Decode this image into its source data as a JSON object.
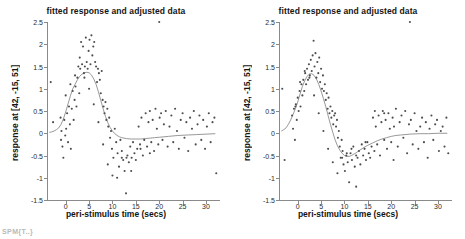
{
  "figure": {
    "bottom_fragment": "SPM{T..}",
    "accent_point_color": "#4d4d4d",
    "accent_curve_color": "#8c8c8c",
    "axis_color": "#8a8a8a"
  },
  "panels": [
    {
      "id": "left",
      "title": "fitted response and adjusted data",
      "ylabel": "response at [42, -15, 51]",
      "xlabel": "peri-stimulus time (secs)"
    },
    {
      "id": "right",
      "title": "fitted response and adjusted data",
      "ylabel": "response at [42, -15, 51]",
      "xlabel": "peri-stimulus time (secs)"
    }
  ],
  "chart_data": [
    {
      "type": "scatter",
      "panel": "left",
      "title": "fitted response and adjusted data",
      "xlabel": "peri-stimulus time (secs)",
      "ylabel": "response at [42, -15, 51]",
      "xlim": [
        -4,
        33
      ],
      "ylim": [
        -1.5,
        2.5
      ],
      "xticks": [
        0,
        5,
        10,
        15,
        20,
        25,
        30
      ],
      "yticks": [
        -1.5,
        -1,
        -0.5,
        0,
        0.5,
        1,
        1.5,
        2,
        2.5
      ],
      "xtick_labels": [
        "0",
        "5",
        "10",
        "15",
        "20",
        "25",
        "30"
      ],
      "ytick_labels": [
        "-1.5",
        "-1",
        "-0.5",
        "0",
        "0.5",
        "1",
        "1.5",
        "2",
        "2.5"
      ],
      "grid": false,
      "legend": null,
      "series": [
        {
          "name": "fitted response",
          "type": "line",
          "x": [
            -3.5,
            -3,
            -2.5,
            -2,
            -1.5,
            -1,
            -0.5,
            0,
            0.5,
            1,
            1.5,
            2,
            2.5,
            3,
            3.5,
            4,
            4.5,
            5,
            5.5,
            6,
            6.5,
            7,
            7.5,
            8,
            8.5,
            9,
            9.5,
            10,
            10.5,
            11,
            11.5,
            12,
            13,
            14,
            15,
            16,
            17,
            18,
            19,
            20,
            22,
            24,
            26,
            28,
            30,
            32
          ],
          "y": [
            0.02,
            0.03,
            0.05,
            0.08,
            0.12,
            0.2,
            0.32,
            0.48,
            0.66,
            0.84,
            1.0,
            1.1,
            1.2,
            1.28,
            1.33,
            1.36,
            1.37,
            1.36,
            1.31,
            1.22,
            1.1,
            0.93,
            0.74,
            0.55,
            0.38,
            0.24,
            0.13,
            0.05,
            -0.01,
            -0.05,
            -0.08,
            -0.1,
            -0.12,
            -0.13,
            -0.13,
            -0.13,
            -0.12,
            -0.11,
            -0.1,
            -0.09,
            -0.07,
            -0.05,
            -0.04,
            -0.03,
            -0.02,
            -0.01
          ]
        },
        {
          "name": "adjusted data",
          "type": "scatter",
          "x": [
            -3.2,
            -2.7,
            -1.1,
            -0.9,
            -0.7,
            -0.5,
            -0.3,
            -0.1,
            0.1,
            0.3,
            0.5,
            0.7,
            0.9,
            1.1,
            1.3,
            1.5,
            1.7,
            1.9,
            2.1,
            2.3,
            2.5,
            2.7,
            2.9,
            3.1,
            3.3,
            3.5,
            3.7,
            3.9,
            4.1,
            4.3,
            4.5,
            4.7,
            4.9,
            5.1,
            5.3,
            5.5,
            5.7,
            5.9,
            6.1,
            6.3,
            6.5,
            6.7,
            6.9,
            7.1,
            7.3,
            7.5,
            7.7,
            7.9,
            8.1,
            8.3,
            8.5,
            8.7,
            8.9,
            9.1,
            9.3,
            9.5,
            9.7,
            9.9,
            10.2,
            10.5,
            10.8,
            11.1,
            11.4,
            11.7,
            12.0,
            12.3,
            12.6,
            12.9,
            13.2,
            13.5,
            13.8,
            14.1,
            14.4,
            14.7,
            15.0,
            15.3,
            15.6,
            15.9,
            16.2,
            16.5,
            16.8,
            17.1,
            17.4,
            17.7,
            18.0,
            18.3,
            18.6,
            18.9,
            19.2,
            19.5,
            19.8,
            20.1,
            20.4,
            20.7,
            21.0,
            21.4,
            21.8,
            22.2,
            22.6,
            23.0,
            23.4,
            23.8,
            24.2,
            24.6,
            25.0,
            25.4,
            25.8,
            26.2,
            26.6,
            27.0,
            27.4,
            27.8,
            28.2,
            28.6,
            29.0,
            29.4,
            29.8,
            30.2,
            30.6,
            31.0,
            31.4,
            31.8,
            32.2,
            -1.0,
            0.0,
            1.0,
            2.0,
            3.0,
            4.0,
            5.0,
            6.0,
            7.0,
            8.0,
            9.0,
            10.0,
            11.0,
            12.0,
            13.0,
            14.0,
            16.0,
            18.0,
            20.0
          ],
          "y": [
            1.15,
            0.25,
            0.35,
            0.05,
            -0.3,
            -0.55,
            0.3,
            -0.05,
            0.1,
            0.45,
            -0.2,
            0.6,
            0.2,
            -0.35,
            0.55,
            0.95,
            0.3,
            0.75,
            1.05,
            0.6,
            1.25,
            1.5,
            0.9,
            1.45,
            2.05,
            1.55,
            1.95,
            1.35,
            1.5,
            2.15,
            1.6,
            1.45,
            1.85,
            2.1,
            1.55,
            2.2,
            1.75,
            1.95,
            2.05,
            1.6,
            1.5,
            1.15,
            1.45,
            1.35,
            1.2,
            0.9,
            1.4,
            0.75,
            0.6,
            0.45,
            0.7,
            0.3,
            0.55,
            0.15,
            0.35,
            -0.1,
            0.05,
            -0.35,
            -0.55,
            0.1,
            -0.2,
            -0.45,
            -0.75,
            -0.15,
            -0.55,
            -0.6,
            -0.85,
            -1.35,
            -0.5,
            -0.65,
            -0.3,
            -0.55,
            -0.2,
            -0.45,
            -0.6,
            -0.35,
            0.15,
            -0.25,
            0.35,
            -0.5,
            -0.15,
            0.45,
            -0.3,
            0.25,
            0.5,
            -0.2,
            0.3,
            -0.4,
            0.55,
            0.1,
            -0.25,
            0.35,
            0.45,
            -0.15,
            0.2,
            0.5,
            -0.3,
            0.15,
            0.4,
            -0.2,
            0.55,
            0.05,
            -0.35,
            0.3,
            0.45,
            -0.1,
            0.25,
            -0.4,
            0.35,
            0.1,
            0.5,
            -0.25,
            0.2,
            0.4,
            -0.15,
            0.3,
            -0.35,
            0.15,
            0.45,
            -0.2,
            0.25,
            0.35,
            -0.9,
            -0.15,
            0.85,
            1.1,
            1.3,
            1.7,
            1.25,
            1.0,
            0.65,
            0.25,
            -0.25,
            -0.7,
            -0.95,
            -1.0,
            -0.4,
            -0.55,
            -0.85,
            -0.35,
            -0.45
          ]
        }
      ]
    },
    {
      "type": "scatter",
      "panel": "right",
      "title": "fitted response and adjusted data",
      "xlabel": "peri-stimulus time (secs)",
      "ylabel": "response at [42, -15, 51]",
      "xlim": [
        -4,
        33
      ],
      "ylim": [
        -1.5,
        2.5
      ],
      "xticks": [
        0,
        5,
        10,
        15,
        20,
        25,
        30
      ],
      "yticks": [
        -1.5,
        -1,
        -0.5,
        0,
        0.5,
        1,
        1.5,
        2,
        2.5
      ],
      "xtick_labels": [
        "0",
        "5",
        "10",
        "15",
        "20",
        "25",
        "30"
      ],
      "ytick_labels": [
        "-1.5",
        "-1",
        "-0.5",
        "0",
        "0.5",
        "1",
        "1.5",
        "2",
        "2.5"
      ],
      "grid": false,
      "legend": null,
      "series": [
        {
          "name": "fitted response",
          "type": "line",
          "x": [
            -3.5,
            -3,
            -2.5,
            -2,
            -1.5,
            -1,
            -0.5,
            0,
            0.5,
            1,
            1.5,
            2,
            2.5,
            3,
            3.5,
            4,
            4.5,
            5,
            5.5,
            6,
            6.5,
            7,
            7.5,
            8,
            8.5,
            9,
            9.5,
            10,
            10.5,
            11,
            11.5,
            12,
            12.5,
            13,
            14,
            15,
            16,
            17,
            18,
            19,
            20,
            21,
            22,
            24,
            26,
            28,
            30,
            32
          ],
          "y": [
            0.05,
            0.08,
            0.12,
            0.2,
            0.3,
            0.42,
            0.55,
            0.7,
            0.88,
            1.05,
            1.18,
            1.28,
            1.33,
            1.34,
            1.3,
            1.22,
            1.1,
            0.95,
            0.78,
            0.6,
            0.4,
            0.2,
            0.02,
            -0.15,
            -0.28,
            -0.38,
            -0.45,
            -0.5,
            -0.52,
            -0.52,
            -0.5,
            -0.47,
            -0.44,
            -0.4,
            -0.33,
            -0.27,
            -0.22,
            -0.17,
            -0.13,
            -0.1,
            -0.07,
            -0.05,
            -0.04,
            -0.02,
            -0.01,
            -0.01,
            0.0,
            0.0
          ]
        },
        {
          "name": "adjusted data",
          "type": "scatter",
          "x": [
            -3.3,
            -2.8,
            -1.2,
            -1.0,
            -0.8,
            -0.6,
            -0.4,
            -0.2,
            0.0,
            0.2,
            0.4,
            0.6,
            0.8,
            1.0,
            1.2,
            1.4,
            1.6,
            1.8,
            2.0,
            2.2,
            2.4,
            2.6,
            2.8,
            3.0,
            3.2,
            3.4,
            3.6,
            3.8,
            4.0,
            4.2,
            4.4,
            4.6,
            4.8,
            5.0,
            5.2,
            5.4,
            5.6,
            5.8,
            6.0,
            6.2,
            6.4,
            6.6,
            6.8,
            7.0,
            7.2,
            7.4,
            7.6,
            7.8,
            8.0,
            8.2,
            8.4,
            8.6,
            8.8,
            9.0,
            9.2,
            9.4,
            9.6,
            9.8,
            10.1,
            10.4,
            10.7,
            11.0,
            11.3,
            11.6,
            11.9,
            12.2,
            12.5,
            12.8,
            13.1,
            13.4,
            13.7,
            14.0,
            14.3,
            14.6,
            14.9,
            15.2,
            15.5,
            15.8,
            16.1,
            16.4,
            16.7,
            17.0,
            17.3,
            17.6,
            17.9,
            18.2,
            18.5,
            18.8,
            19.1,
            19.4,
            19.7,
            20.0,
            20.3,
            20.6,
            21.0,
            21.4,
            21.8,
            22.2,
            22.6,
            23.0,
            23.4,
            23.8,
            24.2,
            24.6,
            25.0,
            25.4,
            25.8,
            26.2,
            26.6,
            27.0,
            27.4,
            27.8,
            28.2,
            28.6,
            29.0,
            29.4,
            29.8,
            30.2,
            30.6,
            31.0,
            31.4,
            31.8,
            32.2,
            -0.5,
            0.5,
            1.5,
            2.5,
            3.5,
            4.5,
            5.5,
            6.5,
            7.5,
            8.5,
            9.5,
            10.5,
            11.5,
            12.5,
            14.5,
            16.5,
            18.5,
            20.5,
            24.0
          ],
          "y": [
            1.0,
            -0.6,
            0.4,
            0.1,
            0.55,
            -0.15,
            0.65,
            0.3,
            0.8,
            0.5,
            0.95,
            0.6,
            1.1,
            0.85,
            1.2,
            0.95,
            1.35,
            1.1,
            1.45,
            1.2,
            1.55,
            1.3,
            1.65,
            1.4,
            1.75,
            2.08,
            1.5,
            1.8,
            1.25,
            1.6,
            1.35,
            1.7,
            1.15,
            1.45,
            1.0,
            1.3,
            0.95,
            1.1,
            0.75,
            0.9,
            0.55,
            0.8,
            0.45,
            0.6,
            0.35,
            0.5,
            0.2,
            0.4,
            0.45,
            0.15,
            0.3,
            -0.1,
            0.05,
            -0.3,
            -0.55,
            -0.15,
            -0.4,
            -0.7,
            -0.85,
            -0.5,
            -0.65,
            -1.1,
            -0.45,
            -0.6,
            -0.3,
            -0.75,
            -1.2,
            -0.55,
            -0.4,
            -0.7,
            -0.25,
            -0.5,
            -0.35,
            -0.6,
            -0.2,
            -0.45,
            -0.55,
            -0.3,
            0.35,
            -0.4,
            0.15,
            -0.25,
            0.4,
            -0.5,
            0.25,
            0.5,
            -0.15,
            0.3,
            -0.35,
            0.45,
            0.1,
            -0.2,
            0.35,
            0.15,
            0.55,
            -0.3,
            0.25,
            0.4,
            -0.1,
            0.5,
            -0.45,
            0.2,
            0.3,
            -0.25,
            0.45,
            0.05,
            -0.35,
            0.15,
            0.35,
            -0.2,
            0.25,
            -0.55,
            0.1,
            0.4,
            -0.15,
            0.2,
            0.3,
            -0.4,
            0.05,
            0.15,
            -0.3,
            0.35,
            -0.45,
            0.6,
            1.15,
            1.4,
            1.25,
            0.85,
            0.45,
            0.05,
            -0.35,
            -0.65,
            -0.9,
            -0.55,
            -0.45,
            -0.35,
            -0.5,
            -0.2,
            0.5,
            0.45,
            -0.6
          ]
        }
      ]
    }
  ]
}
